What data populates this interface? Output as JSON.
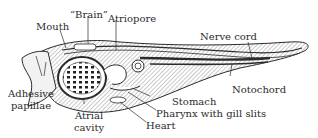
{
  "figure": {
    "labels": {
      "mouth": "Mouth",
      "brain": "“Brain”",
      "atriopore": "Atriopore",
      "nerve_cord": "Nerve cord",
      "notochord": "Notochord",
      "adhesive_papillae_1": "Adhesive",
      "adhesive_papillae_2": "papillae",
      "atrial_cavity_1": "Atrial",
      "atrial_cavity_2": "cavity",
      "stomach": "Stomach",
      "pharynx": "Pharynx with gill slits",
      "heart": "Heart"
    },
    "colors": {
      "ink": "#2b2b2b",
      "background": "#ffffff",
      "hatch": "#8a8a8a"
    }
  }
}
